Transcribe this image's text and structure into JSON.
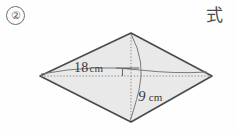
{
  "problem": {
    "number": "②",
    "answer_prompt": "式"
  },
  "figure": {
    "shape_name": "rhombus",
    "fill_color": "#e9e9e9",
    "outline_color": "#4a4a4a",
    "diagonal_color": "#8c8c8c",
    "vertices": {
      "left": {
        "x": 40,
        "y": 76
      },
      "top": {
        "x": 131,
        "y": 33
      },
      "right": {
        "x": 212,
        "y": 76
      },
      "bottom": {
        "x": 131,
        "y": 122
      }
    },
    "right_angle_mark": true,
    "labels": {
      "horizontal_diagonal": {
        "value": "18",
        "unit": "cm"
      },
      "vertical_diagonal": {
        "value": "9",
        "unit": "cm"
      }
    }
  }
}
